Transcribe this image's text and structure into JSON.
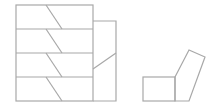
{
  "diagram": {
    "stroke_color": "#a8a8a8",
    "background": "#ffffff",
    "stack": {
      "rows": 4,
      "x": 16,
      "y": 5,
      "width": 77,
      "row_height": 24,
      "slant": {
        "x_top": 46,
        "x_bottom": 62
      }
    },
    "side_box": {
      "x": 93,
      "y": 21,
      "width": 23,
      "height": 80,
      "diagonal": {
        "x1": 93,
        "y1": 69,
        "x2": 116,
        "y2": 53
      }
    },
    "small_figure": {
      "square": {
        "x": 143,
        "y": 77,
        "width": 32,
        "height": 24
      },
      "rotated_square": [
        [
          175,
          77
        ],
        [
          189,
          50
        ],
        [
          205,
          57
        ],
        [
          189,
          101
        ]
      ]
    }
  }
}
